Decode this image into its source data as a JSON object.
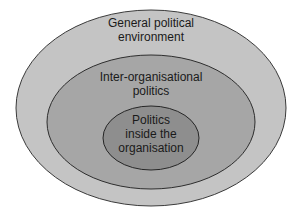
{
  "diagram": {
    "type": "nested-ellipses",
    "layers": [
      {
        "id": "outer",
        "lines": [
          "General political",
          "environment"
        ],
        "fill": "#c4c4c4",
        "stroke": "#3a3a3a",
        "cx": 151,
        "cy": 108,
        "rx": 135,
        "ry": 98
      },
      {
        "id": "middle",
        "lines": [
          "Inter-organisational",
          "politics"
        ],
        "fill": "#a6a6a6",
        "stroke": "#2e2e2e",
        "cx": 151,
        "cy": 122,
        "rx": 104,
        "ry": 67
      },
      {
        "id": "inner",
        "lines": [
          "Politics",
          "inside the",
          "organisation"
        ],
        "fill": "#8e8e8e",
        "stroke": "#262626",
        "cx": 151,
        "cy": 138,
        "rx": 48,
        "ry": 32
      }
    ]
  }
}
